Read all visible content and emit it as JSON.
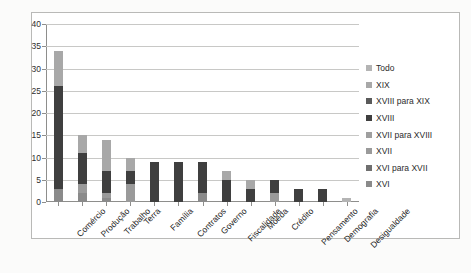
{
  "chart_data": {
    "type": "bar",
    "subtype": "stacked-bar-vertical",
    "title": "",
    "xlabel": "",
    "ylabel": "",
    "ylim": [
      0,
      40
    ],
    "yticks": [
      0,
      5,
      10,
      15,
      20,
      25,
      30,
      35,
      40
    ],
    "grid": true,
    "legend_position": "right",
    "categories": [
      "Comércio",
      "Produção",
      "Trabalho",
      "Terra",
      "Família",
      "Contratos",
      "Governo",
      "Fiscalidade",
      "Moeda",
      "Crédito",
      "Pensamento",
      "Demografia",
      "Desigualdade"
    ],
    "series": [
      {
        "name": "XVI",
        "color": "#8a8a8a",
        "values": [
          3,
          2,
          1,
          0,
          0,
          0,
          2,
          0,
          0,
          0,
          0,
          0,
          0
        ]
      },
      {
        "name": "XVI para XVII",
        "color": "#6f6f6f",
        "values": [
          0,
          0,
          0,
          0,
          0,
          0,
          0,
          0,
          0,
          0,
          0,
          0,
          0
        ]
      },
      {
        "name": "XVII",
        "color": "#9a9a9a",
        "values": [
          0,
          2,
          1,
          4,
          0,
          0,
          0,
          0,
          0,
          2,
          0,
          0,
          0
        ]
      },
      {
        "name": "XVII para XVIII",
        "color": "#9f9f9f",
        "values": [
          0,
          0,
          0,
          0,
          0,
          0,
          0,
          0,
          0,
          0,
          0,
          0,
          0
        ]
      },
      {
        "name": "XVIII",
        "color": "#3f3f3f",
        "values": [
          23,
          7,
          5,
          3,
          9,
          9,
          7,
          5,
          3,
          3,
          3,
          3,
          0
        ]
      },
      {
        "name": "XVII para XIX",
        "color": "#5a5a5a",
        "values": [
          0,
          0,
          0,
          0,
          0,
          0,
          0,
          0,
          0,
          0,
          0,
          0,
          0
        ]
      },
      {
        "name": "XIX",
        "color": "#a8a8a8",
        "values": [
          8,
          4,
          7,
          3,
          0,
          0,
          0,
          2,
          2,
          0,
          0,
          0,
          0
        ]
      },
      {
        "name": "Todo",
        "color": "#b4b4b4",
        "values": [
          0,
          0,
          0,
          0,
          0,
          0,
          0,
          0,
          0,
          0,
          0,
          0,
          1
        ]
      }
    ],
    "totals": [
      34,
      15,
      14,
      10,
      9,
      9,
      9,
      7,
      5,
      5,
      3,
      3,
      1
    ]
  },
  "legend": {
    "items": [
      {
        "label": "Todo",
        "color": "#b4b4b4"
      },
      {
        "label": "XIX",
        "color": "#a8a8a8"
      },
      {
        "label": "XVIII para XIX",
        "color": "#5a5a5a"
      },
      {
        "label": "XVIII",
        "color": "#3f3f3f"
      },
      {
        "label": "XVII para XVIII",
        "color": "#9f9f9f"
      },
      {
        "label": "XVII",
        "color": "#9a9a9a"
      },
      {
        "label": "XVI para XVII",
        "color": "#6f6f6f"
      },
      {
        "label": "XVI",
        "color": "#8a8a8a"
      }
    ]
  },
  "artifacts": {
    "bleed_text": "scanned page bleed-through"
  }
}
